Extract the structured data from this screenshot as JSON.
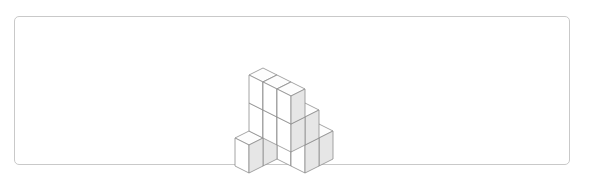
{
  "frame": {
    "name": "diagram-frame",
    "border_color": "#c9c9c9",
    "background": "#ffffff",
    "x": 14,
    "y": 16,
    "width": 556,
    "height": 149,
    "corner_radius": 5
  },
  "figure": {
    "title": "",
    "type": "isometric-cube-stack",
    "cube_count": 17,
    "projection": {
      "half_width": 14,
      "half_height": 7,
      "cube_height": 28,
      "origin_x": 291,
      "origin_y": 138
    },
    "colors": {
      "top_face": "#fdfdfd",
      "left_face": "#ffffff",
      "right_face": "#e6e6e6",
      "stroke": "#8d8d8d",
      "stroke_width": 0.8
    },
    "voxels": [
      {
        "x": 0,
        "y": 0,
        "z": 0
      },
      {
        "x": 1,
        "y": 0,
        "z": 0
      },
      {
        "x": 2,
        "y": 0,
        "z": 0
      },
      {
        "x": 0,
        "y": 1,
        "z": 0
      },
      {
        "x": 1,
        "y": 1,
        "z": 0
      },
      {
        "x": 2,
        "y": 1,
        "z": 0
      },
      {
        "x": 0,
        "y": 2,
        "z": 0
      },
      {
        "x": 0,
        "y": 3,
        "z": 0
      },
      {
        "x": 0,
        "y": 1,
        "z": 1
      },
      {
        "x": 1,
        "y": 1,
        "z": 1
      },
      {
        "x": 2,
        "y": 1,
        "z": 1
      },
      {
        "x": 0,
        "y": 2,
        "z": 1
      },
      {
        "x": 1,
        "y": 2,
        "z": 1
      },
      {
        "x": 2,
        "y": 2,
        "z": 1
      },
      {
        "x": 0,
        "y": 2,
        "z": 2
      },
      {
        "x": 1,
        "y": 2,
        "z": 2
      },
      {
        "x": 2,
        "y": 2,
        "z": 2
      }
    ]
  }
}
